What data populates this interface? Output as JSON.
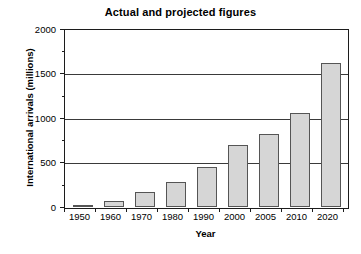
{
  "chart_data": {
    "type": "bar",
    "title": "Actual and projected figures",
    "xlabel": "Year",
    "ylabel": "International arrivals (millions)",
    "categories": [
      "1950",
      "1960",
      "1970",
      "1980",
      "1990",
      "2000",
      "2005",
      "2010",
      "2020"
    ],
    "values": [
      25,
      69,
      165,
      280,
      450,
      700,
      820,
      1060,
      1620
    ],
    "ylim": [
      0,
      2000
    ],
    "ytick_labels": [
      "0",
      "500",
      "1000",
      "1500",
      "2000"
    ],
    "ytick_values": [
      0,
      500,
      1000,
      1500,
      2000
    ],
    "yminor_ticks": [
      250,
      750,
      1250,
      1750
    ],
    "grid": "horizontal",
    "legend": "none",
    "colors": {
      "bar_fill": "#d6d6d6",
      "bar_border": "#555555",
      "axis": "#1c1c1c",
      "gridline": "#3a3a3a",
      "background": "#ffffff",
      "text": "#000000"
    }
  }
}
